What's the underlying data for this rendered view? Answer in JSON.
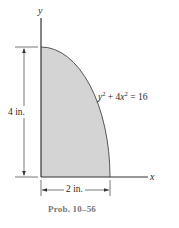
{
  "figure": {
    "caption": "Prob. 10–56",
    "axes": {
      "x_label": "x",
      "y_label": "y"
    },
    "curve_equation": {
      "y_term": "y",
      "y_exp": "2",
      "plus": " + 4",
      "x_term": "x",
      "x_exp": "2",
      "rhs": " = 16"
    },
    "dimensions": {
      "height": "4 in.",
      "width": "2 in."
    },
    "region": {
      "description": "Shaded region bounded by the y-axis, the x-axis and the curve y^2 + 4x^2 = 16 in the first quadrant",
      "fill_color": "#d4d4d4",
      "stroke_color": "#555555"
    }
  }
}
